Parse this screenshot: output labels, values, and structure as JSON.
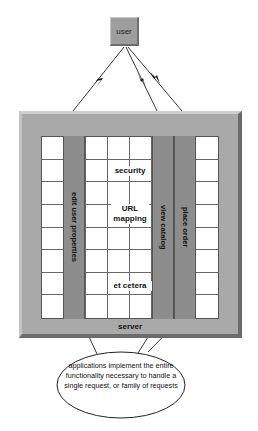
{
  "diagram": {
    "user": {
      "label": "user"
    },
    "server": {
      "label": "server"
    },
    "grid": {
      "columns": 8,
      "rows": 8
    },
    "applications": [
      {
        "label": "edit user properties",
        "column": 2
      },
      {
        "label": "view catalog",
        "column": 6
      },
      {
        "label": "place order",
        "column": 7
      }
    ],
    "services": [
      {
        "label": "security"
      },
      {
        "label": "URL mapping"
      },
      {
        "label": "et cetera"
      }
    ],
    "callout": {
      "text": "applications implement the entire functionality necessary to handle a single request, or family of requests"
    },
    "connections": [
      {
        "from": "user",
        "to": "server",
        "style": "lightning"
      },
      {
        "from": "user",
        "to": "server",
        "style": "lightning"
      },
      {
        "from": "user",
        "to": "server",
        "style": "lightning"
      }
    ],
    "colors": {
      "server_frame": "#a9a9a9",
      "application_column": "#8d8d8d",
      "grid_cell": "#ffffff",
      "user_box": "#9e9e9e"
    }
  }
}
